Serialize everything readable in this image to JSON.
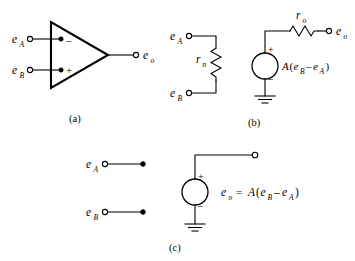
{
  "figure": {
    "panels": [
      {
        "id": "a",
        "caption": "(a)",
        "description": "op-amp schematic symbol with inverting and non-inverting inputs",
        "labels": {
          "input_a": "e",
          "input_a_sub": "A",
          "input_b": "e",
          "input_b_sub": "B",
          "output": "e",
          "output_sub": "o",
          "inverting_sign": "–",
          "noninverting_sign": "+"
        }
      },
      {
        "id": "b",
        "caption": "(b)",
        "description": "equivalent circuit with input resistance r_n, dependent source and output resistance r_o",
        "labels": {
          "input_a": "e",
          "input_a_sub": "A",
          "input_b": "e",
          "input_b_sub": "B",
          "input_resistor": "r",
          "input_resistor_sub": "n",
          "output_resistor": "r",
          "output_resistor_sub": "o",
          "output": "e",
          "output_sub": "o",
          "source_plus": "+",
          "source_minus": "–",
          "source_expr_gain": "A",
          "source_expr_open": "(",
          "source_expr_e1": "e",
          "source_expr_e1_sub": "B",
          "source_expr_minus": "–",
          "source_expr_e2": "e",
          "source_expr_e2_sub": "A",
          "source_expr_close": ")",
          "ground": "ground-symbol"
        }
      },
      {
        "id": "c",
        "caption": "(c)",
        "description": "ideal op-amp model: open input terminals and ideal dependent voltage source",
        "labels": {
          "input_a": "e",
          "input_a_sub": "A",
          "input_b": "e",
          "input_b_sub": "B",
          "source_plus": "+",
          "source_minus": "–",
          "source_out": "e",
          "source_out_sub": "o",
          "equals": "=",
          "source_expr_gain": "A",
          "source_expr_open": "(",
          "source_expr_e1": "e",
          "source_expr_e1_sub": "B",
          "source_expr_minus": "–",
          "source_expr_e2": "e",
          "source_expr_e2_sub": "A",
          "source_expr_close": ")",
          "ground": "ground-symbol"
        }
      }
    ],
    "colors": {
      "ink": "#000000",
      "paper": "#ffffff"
    }
  }
}
